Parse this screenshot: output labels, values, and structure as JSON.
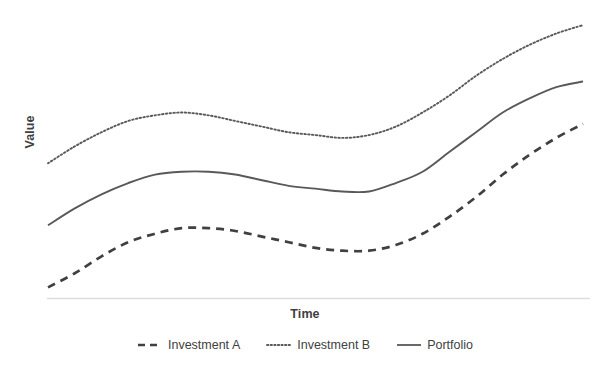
{
  "chart_data": {
    "type": "line",
    "title": "",
    "subtitle": "",
    "xlabel": "Time",
    "ylabel": "Value",
    "xlim": [
      0,
      100
    ],
    "ylim": [
      0,
      100
    ],
    "grid": false,
    "x_tick_labels": [],
    "y_tick_labels": [],
    "legend_position": "bottom",
    "axis_line_color": "#d9d9d9",
    "x": [
      0,
      5,
      10,
      15,
      20,
      25,
      30,
      35,
      40,
      45,
      50,
      55,
      60,
      65,
      70,
      75,
      80,
      85,
      90,
      95,
      100
    ],
    "series": [
      {
        "name": "Investment A",
        "style": "dashed",
        "color": "#404040",
        "values": [
          2,
          7,
          13,
          18,
          21,
          23,
          23,
          22,
          20,
          18,
          16,
          15,
          15,
          17,
          21,
          27,
          34,
          42,
          49,
          55,
          60
        ]
      },
      {
        "name": "Investment B",
        "style": "dotted",
        "color": "#595959",
        "values": [
          46,
          52,
          57,
          61,
          63,
          64,
          63,
          61,
          59,
          57,
          56,
          55,
          56,
          59,
          64,
          70,
          77,
          83,
          88,
          92,
          95
        ]
      },
      {
        "name": "Portfolio",
        "style": "solid",
        "color": "#595959",
        "values": [
          24,
          30,
          35,
          39,
          42,
          43,
          43,
          42,
          40,
          38,
          37,
          36,
          36,
          39,
          43,
          50,
          57,
          64,
          69,
          73,
          75
        ]
      }
    ]
  },
  "axes": {
    "y_title": "Value",
    "x_title": "Time"
  },
  "legend": {
    "items": [
      {
        "label": "Investment A",
        "marker": "dashed-line-icon"
      },
      {
        "label": "Investment B",
        "marker": "dotted-line-icon"
      },
      {
        "label": "Portfolio",
        "marker": "solid-line-icon"
      }
    ]
  }
}
